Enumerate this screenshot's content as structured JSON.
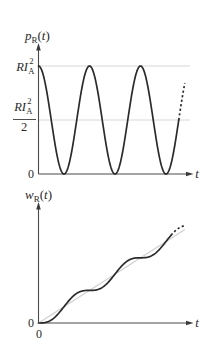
{
  "figure": {
    "top": {
      "ylabel": {
        "main": "p",
        "sub": "R",
        "open": "(",
        "arg": "t",
        "close": ")"
      },
      "tick_max": {
        "main": "RI",
        "sub": "A",
        "sup": "2"
      },
      "tick_half": {
        "main": "RI",
        "sub": "A",
        "sup": "2",
        "den": "2"
      },
      "tick_zero": "0",
      "xlabel": "t"
    },
    "bottom": {
      "ylabel": {
        "main": "w",
        "sub": "R",
        "open": "(",
        "arg": "t",
        "close": ")"
      },
      "tick_zero_y": "0",
      "tick_zero_x": "0",
      "xlabel": "t"
    }
  },
  "chart_data": [
    {
      "type": "line",
      "title": "",
      "ylabel": "p_R(t)",
      "xlabel": "t",
      "yticks": [
        "0",
        "RI_A^2/2",
        "RI_A^2"
      ],
      "ytick_values": [
        0,
        0.5,
        1.0
      ],
      "ylim": [
        0,
        1.0
      ],
      "grid": "horizontal reference lines at RI_A^2 and RI_A^2/2",
      "x_units": "periods T of p_R(t)",
      "x": [
        0,
        0.25,
        0.5,
        0.75,
        1.0,
        1.25,
        1.5,
        1.75,
        2.0,
        2.25,
        2.5,
        2.75
      ],
      "series": [
        {
          "name": "p_R(t)",
          "style": "solid",
          "values": [
            1.0,
            0.5,
            0.0,
            0.5,
            1.0,
            0.5,
            0.0,
            0.5,
            1.0,
            0.5,
            0.0,
            0.5
          ]
        },
        {
          "name": "p_R(t) continuation",
          "style": "dashed",
          "x": [
            2.75,
            2.87
          ],
          "values": [
            0.5,
            0.87
          ]
        }
      ],
      "solid_range": [
        0,
        2.75
      ],
      "dashed_range": [
        2.75,
        2.87
      ]
    },
    {
      "type": "line",
      "title": "",
      "ylabel": "w_R(t)",
      "xlabel": "t",
      "yticks": [
        "0"
      ],
      "xticks": [
        "0"
      ],
      "x_units": "periods T of p_R(t)",
      "y_units": "RI_A^2 T / 2",
      "x": [
        0,
        0.5,
        1.0,
        1.5,
        2.0,
        2.5
      ],
      "series": [
        {
          "name": "w_R(t)",
          "style": "solid",
          "values": [
            0,
            0.5,
            1.0,
            1.5,
            2.0,
            2.5
          ]
        },
        {
          "name": "w_R(t) continuation",
          "style": "dashed",
          "x": [
            2.6,
            2.87
          ],
          "values": [
            2.69,
            2.92
          ]
        },
        {
          "name": "average energy (linear)",
          "style": "light gray",
          "x": [
            0,
            2.87
          ],
          "values": [
            0,
            2.87
          ]
        }
      ],
      "solid_range": [
        0,
        2.6
      ],
      "dashed_range": [
        2.6,
        2.87
      ]
    }
  ]
}
